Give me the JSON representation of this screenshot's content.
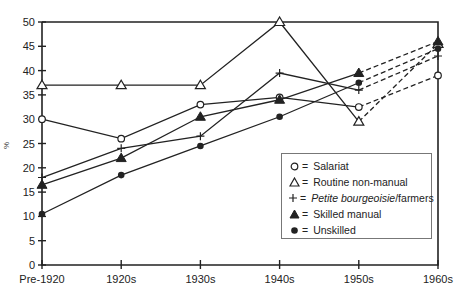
{
  "chart_data": {
    "type": "line",
    "title": "",
    "xlabel": "",
    "ylabel": "%",
    "ylim": [
      0,
      50
    ],
    "yticks": [
      0,
      5,
      10,
      15,
      20,
      25,
      30,
      35,
      40,
      45,
      50
    ],
    "grid": false,
    "legend_position": "lower right inside plot",
    "categories": [
      "Pre-1920",
      "1920s",
      "1930s",
      "1940s",
      "1950s",
      "1960s"
    ],
    "note": "Segment from 1950s to 1960s drawn dashed for all series",
    "series": [
      {
        "name": "Salariat",
        "marker": "open-circle",
        "values": [
          30,
          26,
          33,
          34.5,
          32.5,
          39
        ]
      },
      {
        "name": "Routine non-manual",
        "marker": "open-triangle",
        "values": [
          37,
          37,
          37,
          50,
          29.5,
          45.5
        ]
      },
      {
        "name": "Petite bourgeoisie/farmers",
        "marker": "plus",
        "values": [
          18,
          24,
          26.5,
          39.5,
          36,
          43
        ]
      },
      {
        "name": "Skilled manual",
        "marker": "filled-triangle",
        "values": [
          16.5,
          22,
          30.5,
          34,
          39.5,
          46
        ]
      },
      {
        "name": "Unskilled",
        "marker": "filled-circle",
        "values": [
          10.5,
          18.5,
          24.5,
          30.5,
          37.5,
          44.5
        ]
      }
    ]
  },
  "legend": {
    "eq": "=",
    "items": [
      {
        "label": "Salariat"
      },
      {
        "label": "Routine non-manual"
      },
      {
        "label_italic": "Petite bourgeoisie",
        "label_rest": "/farmers"
      },
      {
        "label": "Skilled manual"
      },
      {
        "label": "Unskilled"
      }
    ]
  },
  "axis": {
    "ylabel": "%"
  },
  "colors": {
    "line": "#222222",
    "axis": "#222222",
    "legend_border": "#777777"
  }
}
